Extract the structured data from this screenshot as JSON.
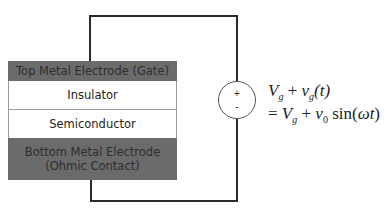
{
  "diagram": {
    "layers": [
      {
        "label_line1": "Top Metal Electrode (Gate)",
        "label_line2": "",
        "fill": "#6b6b6b"
      },
      {
        "label_line1": "Insulator",
        "label_line2": "",
        "fill": "#ffffff"
      },
      {
        "label_line1": "Semiconductor",
        "label_line2": "",
        "fill": "#ffffff"
      },
      {
        "label_line1": "Bottom Metal Electrode",
        "label_line2": "(Ohmic Contact)",
        "fill": "#6b6b6b"
      }
    ],
    "source": {
      "plus": "+",
      "minus": "-"
    },
    "equation": {
      "line1_V": "V",
      "line1_Vsub": "g",
      "line1_plus": " + ",
      "line1_v": "v",
      "line1_vsub": "g",
      "line1_arg": "(t)",
      "line2_eq": "= ",
      "line2_V": "V",
      "line2_Vsub": "g",
      "line2_plus": " + ",
      "line2_v": "v",
      "line2_vsub": "0",
      "line2_sin": " sin(",
      "line2_omega": "ωt",
      "line2_close": ")"
    }
  }
}
